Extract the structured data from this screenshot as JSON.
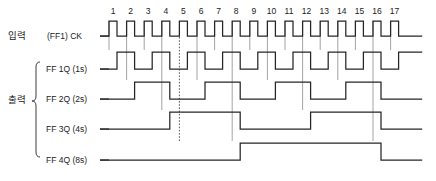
{
  "diagram": {
    "groups": {
      "input_label": "입력",
      "output_label": "출력"
    },
    "rows": [
      {
        "name": "clock",
        "prefix": "(FF1)",
        "signal": "CK",
        "y": 36
      },
      {
        "name": "ff1q",
        "prefix": "",
        "signal": "FF 1Q (1s)",
        "y": 69
      },
      {
        "name": "ff2q",
        "prefix": "",
        "signal": "FF 2Q (2s)",
        "y": 99
      },
      {
        "name": "ff3q",
        "prefix": "",
        "signal": "FF 3Q (4s)",
        "y": 129
      },
      {
        "name": "ff4q",
        "prefix": "",
        "signal": "FF 4Q (8s)",
        "y": 160
      }
    ],
    "clock_numbers": [
      "1",
      "2",
      "3",
      "4",
      "5",
      "6",
      "7",
      "8",
      "9",
      "10",
      "11",
      "12",
      "13",
      "14",
      "15",
      "16",
      "17"
    ],
    "pulse_count": 17,
    "marker_pulse": 5,
    "colors": {
      "wave": "#262626",
      "guide": "#8d8d8d",
      "background": "#ffffff",
      "text": "#1a1a1a"
    }
  },
  "chart_data": {
    "type": "line",
    "xlabel": "Clock pulse",
    "ylabel": "Logic level",
    "x": [
      1,
      2,
      3,
      4,
      5,
      6,
      7,
      8,
      9,
      10,
      11,
      12,
      13,
      14,
      15,
      16,
      17
    ],
    "series": [
      {
        "name": "CK",
        "values": [
          1,
          1,
          1,
          1,
          1,
          1,
          1,
          1,
          1,
          1,
          1,
          1,
          1,
          1,
          1,
          1,
          1
        ]
      },
      {
        "name": "FF 1Q (1s)",
        "values": [
          1,
          0,
          1,
          0,
          1,
          0,
          1,
          0,
          1,
          0,
          1,
          0,
          1,
          0,
          1,
          0,
          1
        ]
      },
      {
        "name": "FF 2Q (2s)",
        "values": [
          0,
          1,
          1,
          0,
          0,
          1,
          1,
          0,
          0,
          1,
          1,
          0,
          0,
          1,
          1,
          0,
          0
        ]
      },
      {
        "name": "FF 3Q (4s)",
        "values": [
          0,
          0,
          0,
          1,
          1,
          1,
          1,
          0,
          0,
          0,
          0,
          1,
          1,
          1,
          1,
          0,
          0
        ]
      },
      {
        "name": "FF 4Q (8s)",
        "values": [
          0,
          0,
          0,
          0,
          0,
          0,
          0,
          1,
          1,
          1,
          1,
          1,
          1,
          1,
          1,
          0,
          0
        ]
      }
    ],
    "legend_position": "left",
    "grid": false
  },
  "geometry": {
    "x_start": 109,
    "pulse_pitch": 17.6,
    "pulse_high_width": 8.0,
    "wave_amplitude": 15,
    "ff_amplitude": 17,
    "tail": 14
  }
}
